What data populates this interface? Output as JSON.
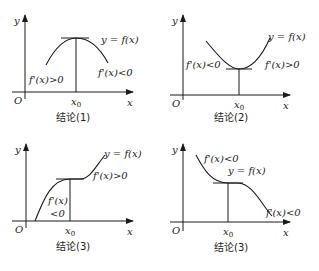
{
  "panels": [
    {
      "id": "1",
      "caption": "结论(1)",
      "axis_y": "y",
      "axis_x": "x",
      "origin": "O",
      "x0_label": "x0",
      "function_label": "y = f(x)",
      "left_label": "f'(x)>0",
      "right_label": "f'(x)<0",
      "type": "local maximum"
    },
    {
      "id": "2",
      "caption": "结论(2)",
      "axis_y": "y",
      "axis_x": "x",
      "origin": "O",
      "x0_label": "x0",
      "function_label": "y = f(x)",
      "left_label": "f'(x)<0",
      "right_label": "f'(x)>0",
      "type": "local minimum"
    },
    {
      "id": "3",
      "caption": "结论(3)",
      "axis_y": "y",
      "axis_x": "x",
      "origin": "O",
      "x0_label": "x0",
      "function_label": "y = f(x)",
      "left_label_line1": "f'(x)",
      "left_label_line2": "<0",
      "right_label": "f'(x)>0",
      "type": "increasing with stationary point"
    },
    {
      "id": "4",
      "caption": "结论(3)",
      "axis_y": "y",
      "axis_x": "x",
      "origin": "O",
      "x0_label": "x0",
      "function_label": "y = f(x)",
      "left_label": "f'(x)<0",
      "right_label": "f'(x)<0",
      "type": "decreasing with stationary point"
    }
  ]
}
